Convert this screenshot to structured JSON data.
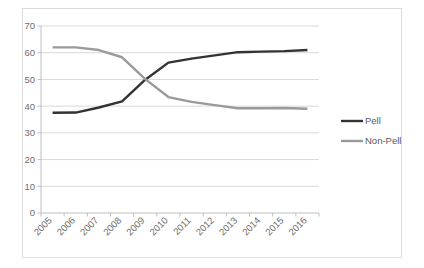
{
  "chart_data": {
    "type": "line",
    "title": "",
    "subtitle": "",
    "xlabel": "",
    "ylabel": "",
    "categories": [
      "2005",
      "2006",
      "2007",
      "2008",
      "2009",
      "2010",
      "2011",
      "2012",
      "2013",
      "2014",
      "2015",
      "2016"
    ],
    "ylim": [
      0,
      70
    ],
    "ytick_values": [
      0,
      10,
      20,
      30,
      40,
      50,
      60,
      70
    ],
    "ytick_labels": [
      "0",
      "10",
      "20",
      "30",
      "40",
      "50",
      "60",
      "70"
    ],
    "grid": "horizontal",
    "legend_position": "right",
    "series": [
      {
        "name": "Pell",
        "color": "#333333",
        "values": [
          37.5,
          37.6,
          39.5,
          41.8,
          49.9,
          56.3,
          57.8,
          59.0,
          60.2,
          60.4,
          60.6,
          61.0
        ]
      },
      {
        "name": "Non-Pell",
        "color": "#9a9a9a",
        "values": [
          62.0,
          62.0,
          61.0,
          58.3,
          50.1,
          43.4,
          41.6,
          40.4,
          39.2,
          39.2,
          39.3,
          39.0
        ]
      }
    ]
  },
  "axes": {
    "y_axis_name": "value-axis",
    "x_axis_name": "category-axis"
  },
  "legend": {
    "entries": [
      {
        "label": "Pell",
        "color": "#333333"
      },
      {
        "label": "Non-Pell",
        "color": "#9a9a9a"
      }
    ]
  },
  "colors": {
    "plot_border": "#dcdcdc",
    "gridline": "#d9d9d9",
    "axis_line": "#bfbfbf",
    "tick_text": "#6e6e6e",
    "legend_text": "#595959",
    "background": "#ffffff"
  }
}
